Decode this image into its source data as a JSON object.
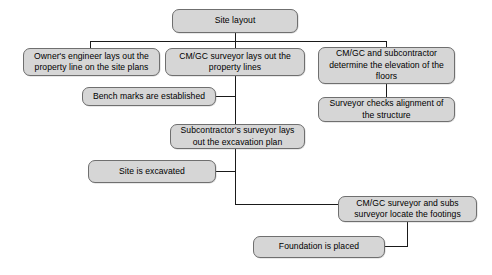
{
  "diagram": {
    "style": {
      "node_fill": "#d6d6d6",
      "node_border": "#6f6f6f",
      "edge_color": "#1a1a1a",
      "text_color": "#000000",
      "background": "#ffffff"
    },
    "nodes": [
      {
        "id": "site_layout",
        "label": "Site layout"
      },
      {
        "id": "owner_engineer",
        "label": "Owner's engineer lays out the property line on the site plans"
      },
      {
        "id": "cmgc_surveyor",
        "label": "CM/GC surveyor lays out the property lines"
      },
      {
        "id": "cmgc_subcontractor",
        "label": "CM/GC and subcontractor determine the elevation of the floors"
      },
      {
        "id": "bench_marks",
        "label": "Bench marks are established"
      },
      {
        "id": "surveyor_checks",
        "label": "Surveyor checks alignment of the structure"
      },
      {
        "id": "sub_surveyor",
        "label": "Subcontractor's surveyor lays out the excavation plan"
      },
      {
        "id": "site_excavated",
        "label": "Site is excavated"
      },
      {
        "id": "locate_footings",
        "label": "CM/GC surveyor and subs surveyor locate the footings"
      },
      {
        "id": "foundation_placed",
        "label": "Foundation is placed"
      }
    ],
    "edges": [
      {
        "from": "site_layout",
        "to": "owner_engineer"
      },
      {
        "from": "site_layout",
        "to": "cmgc_surveyor"
      },
      {
        "from": "site_layout",
        "to": "cmgc_subcontractor"
      },
      {
        "from": "cmgc_subcontractor",
        "to": "surveyor_checks"
      },
      {
        "from": "cmgc_surveyor",
        "to": "bench_marks"
      },
      {
        "from": "cmgc_surveyor",
        "to": "sub_surveyor"
      },
      {
        "from": "sub_surveyor",
        "to": "site_excavated"
      },
      {
        "from": "sub_surveyor",
        "to": "locate_footings"
      },
      {
        "from": "locate_footings",
        "to": "foundation_placed"
      }
    ]
  }
}
